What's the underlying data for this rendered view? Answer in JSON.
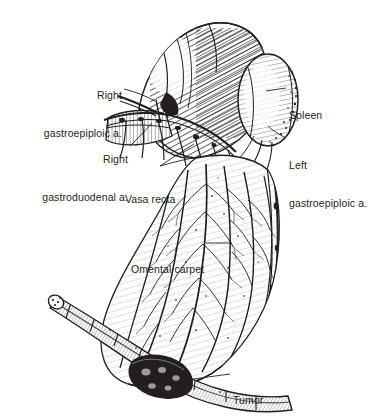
{
  "figure": {
    "style": "pen-and-ink medical line illustration",
    "background_color": "#ffffff",
    "ink_color": "#231f20"
  },
  "labels": [
    {
      "id": "right-gastroepiploic-a",
      "line1": "Right",
      "line2": "gastroepiploic a.",
      "x": 122,
      "y": 64,
      "align": "right"
    },
    {
      "id": "right-gastroduodenal-a",
      "line1": "Right",
      "line2": "gastroduodenal a.",
      "x": 128,
      "y": 128,
      "align": "right"
    },
    {
      "id": "vasa-recta",
      "line1": "Vasa recta",
      "line2": "",
      "x": 125,
      "y": 168,
      "align": "left"
    },
    {
      "id": "omental-carpet",
      "line1": "Omental carpet",
      "line2": "",
      "x": 131,
      "y": 238,
      "align": "left"
    },
    {
      "id": "spleen",
      "line1": "Spleen",
      "line2": "",
      "x": 289,
      "y": 84,
      "align": "left"
    },
    {
      "id": "left-gastroepiploic-a",
      "line1": "Left",
      "line2": "gastroepiploic a.",
      "x": 289,
      "y": 134,
      "align": "left"
    },
    {
      "id": "tumor",
      "line1": "Tumor",
      "line2": "",
      "x": 233,
      "y": 369,
      "align": "left"
    }
  ],
  "anatomy": [
    {
      "name": "stomach",
      "description": "stomach body and fundus, densely hatched"
    },
    {
      "name": "spleen",
      "description": "oval spleen at upper right with stippled margin"
    },
    {
      "name": "duodenum",
      "description": "duodenal stump at left"
    },
    {
      "name": "greater-omentum",
      "description": "omental carpet draping over tumor"
    },
    {
      "name": "transverse-colon",
      "description": "tubular colon crossing lower field"
    },
    {
      "name": "tumor-mass",
      "description": "dark nodular tumor at lower colon bend"
    },
    {
      "name": "gastroepiploic-arcade",
      "description": "vascular arcade along greater curvature"
    }
  ]
}
